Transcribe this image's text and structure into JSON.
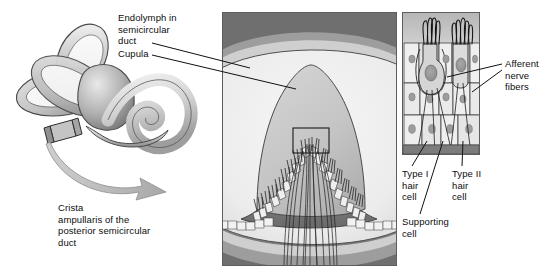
{
  "figure": {
    "width": 554,
    "height": 275,
    "background": "#ffffff"
  },
  "colors": {
    "ink": "#0d0d0d",
    "outline": "#3a3a3a",
    "panel_border": "#5d5d5d",
    "bone_light": "#d9d9d9",
    "bone_mid": "#b5b5b5",
    "bone_dark": "#8c8c8c",
    "bone_shadow": "#6b6b6b",
    "endolymph": "#ededed",
    "cupula": "#c6c6c6",
    "wall_dark": "#7e7e7e",
    "wall_deep": "#5a5a5a",
    "cell_fill": "#e8e8e8",
    "cell_fill_alt": "#d2d2d2",
    "nucleus": "#9a9a9a",
    "arrow": "#b9b9b9",
    "white": "#ffffff"
  },
  "panels": {
    "left": {
      "name": "inner-ear-labyrinth",
      "caption": "Crista\nampullaris of the\nposterior semicircular\nduct"
    },
    "middle": {
      "name": "crista-ampullaris-section",
      "x": 222,
      "y": 12,
      "width": 175,
      "height": 254,
      "inset_box": {
        "x": 292,
        "y": 127,
        "width": 36,
        "height": 25
      }
    },
    "right": {
      "name": "hair-cell-detail",
      "x": 402,
      "y": 12,
      "width": 78,
      "height": 143
    }
  },
  "labels": {
    "endolymph": {
      "text": "Endolymph in\nsemicircular\nduct",
      "x": 118,
      "y": 13
    },
    "cupula": {
      "text": "Cupula",
      "x": 118,
      "y": 50
    },
    "crista": {
      "text": "Crista\nampullaris of the\nposterior semicircular\nduct",
      "x": 58,
      "y": 204
    },
    "afferent": {
      "text": "Afferent\nnerve\nfibers",
      "x": 505,
      "y": 59
    },
    "type_i": {
      "text": "Type I\nhair\ncell",
      "x": 402,
      "y": 170
    },
    "type_ii": {
      "text": "Type II\nhair\ncell",
      "x": 452,
      "y": 170
    },
    "supporting": {
      "text": "Supporting\ncell",
      "x": 402,
      "y": 218
    }
  },
  "leader_lines": [
    {
      "name": "endolymph-leader",
      "from": [
        152,
        43
      ],
      "to": [
        250,
        68
      ]
    },
    {
      "name": "cupula-leader",
      "from": [
        152,
        55
      ],
      "to": [
        296,
        89
      ]
    },
    {
      "name": "afferent-leader-upper",
      "from": [
        502,
        64
      ],
      "to": [
        447,
        77
      ]
    },
    {
      "name": "afferent-leader-lower",
      "from": [
        502,
        70
      ],
      "to": [
        472,
        92
      ]
    },
    {
      "name": "type-i-leader",
      "from": [
        412,
        166
      ],
      "to": [
        427,
        140
      ]
    },
    {
      "name": "type-ii-leader",
      "from": [
        462,
        166
      ],
      "to": [
        463,
        140
      ]
    },
    {
      "name": "supporting-leader",
      "from": [
        420,
        214
      ],
      "to": [
        443,
        140
      ]
    }
  ]
}
